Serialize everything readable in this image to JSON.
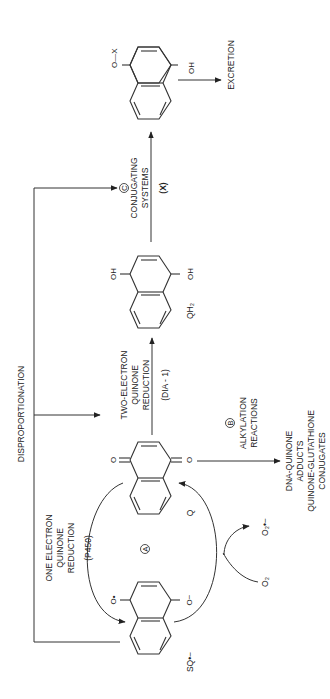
{
  "diagram": {
    "disproportionation_label": "DISPROPORTIONATION",
    "one_electron": {
      "lines": [
        "ONE ELECTRON",
        "QUINONE",
        "REDUCTION"
      ],
      "enzyme": "(P450)"
    },
    "two_electron": {
      "lines": [
        "TWO-ELECTRON",
        "QUINONE",
        "REDUCTION"
      ],
      "enzyme": "(DIA - 1)"
    },
    "pathway_a": {
      "marker": "A"
    },
    "pathway_b": {
      "marker": "B",
      "lines": [
        "ALKYLATION",
        "REACTIONS"
      ]
    },
    "pathway_c": {
      "marker": "C",
      "lines": [
        "CONJUGATING",
        "SYSTEMS"
      ],
      "agent": "(X)"
    },
    "products_b": [
      "DNA-QUINONE",
      "ADDUCTS",
      "QUINONE-GLUTATHIONE",
      "CONJUGATES"
    ],
    "excretion": "EXCRETION",
    "species": {
      "semiquinone": "SQ•−",
      "quinone": "Q",
      "hydroquinone": "QH₂",
      "oxygen": "O₂",
      "superoxide": "O₂•−"
    },
    "atoms": {
      "sq_top": "O•",
      "sq_bottom": "O−",
      "q_top": "O",
      "q_bottom": "O",
      "qh2_top": "OH",
      "qh2_bottom": "OH",
      "conj_top": "O—X",
      "conj_bottom": "OH"
    }
  }
}
